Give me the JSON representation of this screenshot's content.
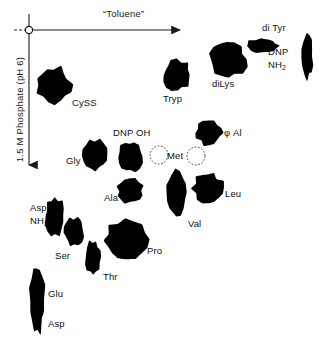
{
  "figure": {
    "background_color": "#ffffff",
    "spot_color": "#000000",
    "axis_color": "#1a1a1a"
  },
  "axes": {
    "x": {
      "label": "“Toluene”",
      "direction": "left-to-right",
      "arrow": "right-arrow-icon"
    },
    "y": {
      "label": "1.5 M Phosphate (pH 6)",
      "direction": "top-to-bottom",
      "arrow": "down-arrow-icon"
    },
    "origin": {
      "marker": "origin-circle-icon",
      "x": 29,
      "y": 30
    }
  },
  "chart_data": {
    "type": "scatter",
    "xlabel": "“Toluene”",
    "ylabel": "1.5 M Phosphate (pH 6)",
    "xlim": [
      0,
      333
    ],
    "ylim": [
      0,
      349
    ],
    "grid": false,
    "legend": "none",
    "note": "Filled black blobs are resolved spots; dotted outlines are faint/variable spots (Met).",
    "spots": [
      {
        "name": "CySS",
        "label": "CySS",
        "cx": 54,
        "cy": 85,
        "rx": 17,
        "ry": 18,
        "style": "filled",
        "label_x": 72,
        "label_y": 97
      },
      {
        "name": "Tryp",
        "label": "Tryp",
        "cx": 177,
        "cy": 75,
        "rx": 14,
        "ry": 15,
        "style": "filled",
        "label_x": 163,
        "label_y": 93
      },
      {
        "name": "diLys",
        "label": "diLys",
        "cx": 228,
        "cy": 60,
        "rx": 19,
        "ry": 18,
        "style": "filled",
        "label_x": 212,
        "label_y": 78
      },
      {
        "name": "diTyr",
        "label": "di Tyr",
        "cx": 262,
        "cy": 46,
        "rx": 16,
        "ry": 7,
        "style": "filled",
        "label_x": 262,
        "label_y": 22
      },
      {
        "name": "DNP-NH2",
        "label": "DNP",
        "label2": "NH",
        "label2_sub": "2",
        "cx": 307,
        "cy": 57,
        "rx": 6,
        "ry": 21,
        "style": "filled",
        "label_x": 268,
        "label_y": 46
      },
      {
        "name": "Gly",
        "label": "Gly",
        "cx": 95,
        "cy": 155,
        "rx": 13,
        "ry": 16,
        "style": "filled",
        "label_x": 66,
        "label_y": 155
      },
      {
        "name": "DNP-OH",
        "label": "DNP OH",
        "cx": 130,
        "cy": 157,
        "rx": 12,
        "ry": 15,
        "style": "filled",
        "label_x": 113,
        "label_y": 127
      },
      {
        "name": "Met-left",
        "label": "",
        "cx": 159,
        "cy": 155,
        "rx": 9,
        "ry": 9,
        "style": "dotted"
      },
      {
        "name": "Met",
        "label": "Met",
        "cx": 178,
        "cy": 155,
        "rx": 0,
        "ry": 0,
        "style": "label-only",
        "label_x": 167,
        "label_y": 150
      },
      {
        "name": "Met-right",
        "label": "",
        "cx": 196,
        "cy": 156,
        "rx": 9,
        "ry": 9,
        "style": "dotted"
      },
      {
        "name": "phi-Al",
        "label": "φ Al",
        "cx": 209,
        "cy": 133,
        "rx": 13,
        "ry": 12,
        "style": "filled",
        "label_x": 224,
        "label_y": 127
      },
      {
        "name": "Ala",
        "label": "Ala",
        "cx": 130,
        "cy": 191,
        "rx": 13,
        "ry": 12,
        "style": "filled",
        "label_x": 104,
        "label_y": 192
      },
      {
        "name": "Val",
        "label": "Val",
        "cx": 176,
        "cy": 193,
        "rx": 11,
        "ry": 23,
        "style": "filled",
        "label_x": 188,
        "label_y": 218
      },
      {
        "name": "Leu",
        "label": "Leu",
        "cx": 208,
        "cy": 188,
        "rx": 15,
        "ry": 15,
        "style": "filled",
        "label_x": 225,
        "label_y": 188
      },
      {
        "name": "Asp-NH2",
        "label": "Asp",
        "label2": "NH",
        "label2_sub": "2",
        "cx": 55,
        "cy": 216,
        "rx": 10,
        "ry": 19,
        "style": "filled",
        "label_x": 30,
        "label_y": 202
      },
      {
        "name": "Ser",
        "label": "Ser",
        "cx": 74,
        "cy": 232,
        "rx": 10,
        "ry": 14,
        "style": "filled",
        "label_x": 55,
        "label_y": 250
      },
      {
        "name": "Thr",
        "label": "Thr",
        "cx": 93,
        "cy": 257,
        "rx": 8,
        "ry": 16,
        "style": "filled",
        "label_x": 103,
        "label_y": 271
      },
      {
        "name": "Pro",
        "label": "Pro",
        "cx": 126,
        "cy": 240,
        "rx": 21,
        "ry": 19,
        "style": "filled",
        "label_x": 147,
        "label_y": 245
      },
      {
        "name": "Glu-Asp",
        "label": "Glu",
        "label2": "Asp",
        "cx": 37,
        "cy": 300,
        "rx": 8,
        "ry": 33,
        "style": "filled",
        "label_x": 48,
        "label_y": 288,
        "label2_x": 48,
        "label2_y": 318
      }
    ]
  }
}
